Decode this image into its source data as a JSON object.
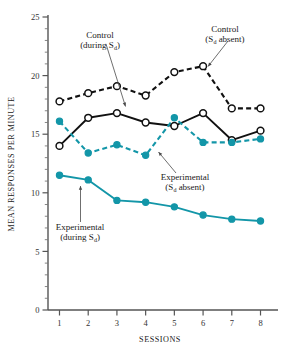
{
  "chart_data": {
    "type": "line",
    "title": "",
    "xlabel": "SESSIONS",
    "ylabel": "MEAN RESPONSES PER MINUTE",
    "x": [
      1,
      2,
      3,
      4,
      5,
      6,
      7,
      8
    ],
    "xlim": [
      0.6,
      8.4
    ],
    "ylim": [
      0,
      25
    ],
    "yticks": [
      0,
      5,
      10,
      15,
      20,
      25
    ],
    "ytick_labels": [
      "0",
      "5",
      "10",
      "15",
      "20",
      "25"
    ],
    "xtick_labels": [
      "1",
      "2",
      "3",
      "4",
      "5",
      "6",
      "7",
      "8"
    ],
    "y_minor_tick_step": 1,
    "grid": false,
    "legend_position": "inline-annotations",
    "series": [
      {
        "name": "Control (Sᵈ absent)",
        "values": [
          17.8,
          18.5,
          19.1,
          18.3,
          20.3,
          20.8,
          17.2,
          17.2
        ],
        "color": "#111111",
        "style": "dashed",
        "marker": "open-circle"
      },
      {
        "name": "Control (during Sᵈ)",
        "values": [
          14.0,
          16.4,
          16.8,
          16.0,
          15.7,
          16.8,
          14.5,
          15.3
        ],
        "color": "#111111",
        "style": "solid",
        "marker": "open-circle"
      },
      {
        "name": "Experimental (Sᵈ absent)",
        "values": [
          16.1,
          13.4,
          14.1,
          13.2,
          16.4,
          14.3,
          14.3,
          14.6
        ],
        "color": "#1396a8",
        "style": "dashed",
        "marker": "filled-circle"
      },
      {
        "name": "Experimental (during Sᵈ)",
        "values": [
          11.5,
          11.1,
          9.35,
          9.2,
          8.8,
          8.1,
          7.75,
          7.6
        ],
        "color": "#1396a8",
        "style": "solid",
        "marker": "filled-circle"
      }
    ],
    "annotations": [
      {
        "id": "control-during-sd",
        "line1": "Control",
        "line2_pre": "(during S",
        "line2_sub": "d",
        "line2_post": ")",
        "points_to_series": "Control (during Sᵈ)",
        "points_to_x": 3
      },
      {
        "id": "control-sd-absent",
        "line1": "Control",
        "line2_pre": "(S",
        "line2_sub": "d",
        "line2_post": " absent)",
        "points_to_series": "Control (Sᵈ absent)",
        "points_to_x": 6
      },
      {
        "id": "experimental-sd-absent",
        "line1": "Experimental",
        "line2_pre": "(S",
        "line2_sub": "d",
        "line2_post": " absent)",
        "points_to_series": "Experimental (Sᵈ absent)",
        "points_to_x": 5
      },
      {
        "id": "experimental-during-sd",
        "line1": "Experimental",
        "line2_pre": "(during S",
        "line2_sub": "d",
        "line2_post": ")",
        "points_to_series": "Experimental (during Sᵈ)",
        "points_to_x": 2
      }
    ],
    "colors": {
      "teal": "#1396a8",
      "black": "#111111",
      "axis": "#555555"
    }
  }
}
